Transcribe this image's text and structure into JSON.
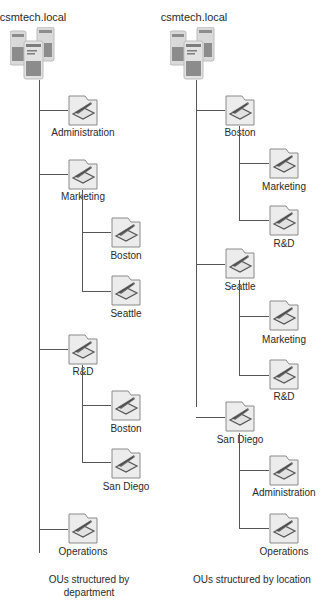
{
  "left_tree": {
    "root": "csmtech.local",
    "caption": "OUs structured by department",
    "children": [
      {
        "label": "Administration",
        "children": []
      },
      {
        "label": "Marketing",
        "children": [
          {
            "label": "Boston"
          },
          {
            "label": "Seattle"
          }
        ]
      },
      {
        "label": "R&D",
        "children": [
          {
            "label": "Boston"
          },
          {
            "label": "San Diego"
          }
        ]
      },
      {
        "label": "Operations",
        "children": []
      }
    ]
  },
  "right_tree": {
    "root": "csmtech.local",
    "caption": "OUs structured by location",
    "children": [
      {
        "label": "Boston",
        "children": [
          {
            "label": "Marketing"
          },
          {
            "label": "R&D"
          }
        ]
      },
      {
        "label": "Seattle",
        "children": [
          {
            "label": "Marketing"
          },
          {
            "label": "R&D"
          }
        ]
      },
      {
        "label": "San Diego",
        "children": [
          {
            "label": "Administration"
          },
          {
            "label": "Operations"
          }
        ]
      }
    ]
  },
  "icons": {
    "root": "domain-servers-icon",
    "ou": "organizational-unit-folder-icon"
  },
  "colors": {
    "line": "#555555",
    "folder_fill": "#ececec",
    "folder_stroke": "#8a8a8a",
    "server_fill": "#d9d9d9",
    "server_dark": "#8c8c8c"
  }
}
